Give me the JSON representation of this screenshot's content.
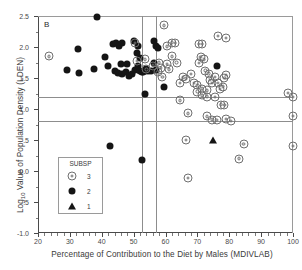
{
  "panel": {
    "label": "B"
  },
  "axes": {
    "xlabel": "Percentage of Contribution to the Diet by Males (MDIVLAB)",
    "ylabel_prefix": "Log",
    "ylabel_sub": "10",
    "ylabel_rest": " Value of Population Density (LDEN)",
    "xticks": [
      "20",
      "30",
      "40",
      "50",
      "60",
      "70",
      "80",
      "90",
      "100"
    ],
    "yticks": [
      "2.5",
      "2.0",
      "1.5",
      "1.0",
      ".5",
      "0.0",
      "-.5",
      "-1.0"
    ]
  },
  "legend": {
    "title": "SUBSP",
    "entries": [
      {
        "label": "3",
        "marker": "open-concentric-circle"
      },
      {
        "label": "2",
        "marker": "filled-circle"
      },
      {
        "label": "1",
        "marker": "filled-triangle"
      }
    ]
  },
  "chart_data": {
    "type": "scatter",
    "title": "",
    "xlabel": "Percentage of Contribution to the Diet by Males (MDIVLAB)",
    "ylabel": "Log10 Value of Population Density (LDEN)",
    "xlim": [
      20,
      100
    ],
    "ylim": [
      -1.0,
      2.5
    ],
    "xtick_values": [
      20,
      30,
      40,
      50,
      60,
      70,
      80,
      90,
      100
    ],
    "ytick_values": [
      2.5,
      2.0,
      1.5,
      1.0,
      0.5,
      0.0,
      -0.5,
      -1.0
    ],
    "grid": false,
    "legend_position": "inside-lower-left",
    "reference_lines": {
      "horizontal": [
        1.2,
        0.8
      ],
      "vertical": [
        52.5,
        57.0
      ]
    },
    "series": [
      {
        "name": "2",
        "marker": "filled-circle",
        "color": "#151515",
        "points": [
          [
            38.5,
            2.49
          ],
          [
            29.0,
            1.63
          ],
          [
            32.5,
            1.96
          ],
          [
            33.0,
            1.58
          ],
          [
            37.5,
            1.64
          ],
          [
            41.0,
            1.84
          ],
          [
            42.0,
            1.7
          ],
          [
            43.5,
            2.05
          ],
          [
            44.5,
            2.07
          ],
          [
            45.5,
            2.02
          ],
          [
            46.5,
            2.06
          ],
          [
            46.0,
            1.72
          ],
          [
            44.0,
            1.62
          ],
          [
            45.0,
            1.58
          ],
          [
            46.5,
            1.56
          ],
          [
            47.5,
            1.6
          ],
          [
            48.0,
            1.72
          ],
          [
            48.5,
            1.54
          ],
          [
            49.5,
            1.56
          ],
          [
            50.5,
            1.63
          ],
          [
            50.0,
            2.09
          ],
          [
            51.0,
            1.9
          ],
          [
            51.5,
            1.7
          ],
          [
            52.0,
            1.61
          ],
          [
            52.5,
            1.6
          ],
          [
            53.0,
            1.59
          ],
          [
            53.5,
            1.62
          ],
          [
            54.0,
            1.64
          ],
          [
            54.5,
            1.62
          ],
          [
            51.5,
            2.02
          ],
          [
            52.0,
            1.82
          ],
          [
            56.5,
            2.1
          ],
          [
            57.0,
            2.02
          ],
          [
            57.5,
            1.98
          ],
          [
            56.5,
            1.74
          ],
          [
            57.0,
            1.63
          ],
          [
            55.5,
            1.61
          ],
          [
            53.5,
            1.25
          ],
          [
            59.5,
            1.35
          ],
          [
            76.0,
            1.7
          ],
          [
            42.5,
            0.4
          ],
          [
            52.5,
            0.17
          ]
        ]
      },
      {
        "name": "3",
        "marker": "open-concentric-circle",
        "color": "#6f6f6f",
        "points": [
          [
            23.5,
            1.85
          ],
          [
            50.5,
            2.06
          ],
          [
            51.0,
            1.77
          ],
          [
            53.5,
            1.8
          ],
          [
            54.0,
            1.64
          ],
          [
            56.0,
            1.7
          ],
          [
            59.5,
            2.35
          ],
          [
            60.5,
            2.01
          ],
          [
            62.0,
            2.07
          ],
          [
            63.0,
            2.06
          ],
          [
            62.0,
            1.85
          ],
          [
            60.5,
            1.73
          ],
          [
            61.0,
            1.64
          ],
          [
            58.5,
            1.66
          ],
          [
            58.0,
            1.75
          ],
          [
            57.5,
            1.59
          ],
          [
            59.0,
            1.52
          ],
          [
            63.5,
            1.75
          ],
          [
            64.5,
            1.42
          ],
          [
            65.5,
            1.51
          ],
          [
            66.5,
            1.49
          ],
          [
            68.0,
            1.56
          ],
          [
            69.0,
            1.42
          ],
          [
            70.5,
            2.05
          ],
          [
            71.5,
            2.05
          ],
          [
            71.0,
            1.84
          ],
          [
            72.0,
            1.8
          ],
          [
            70.5,
            1.74
          ],
          [
            72.5,
            1.62
          ],
          [
            73.5,
            1.57
          ],
          [
            74.0,
            1.47
          ],
          [
            70.0,
            1.38
          ],
          [
            71.5,
            1.33
          ],
          [
            73.0,
            1.3
          ],
          [
            74.5,
            1.42
          ],
          [
            75.5,
            1.52
          ],
          [
            76.5,
            1.42
          ],
          [
            77.0,
            1.32
          ],
          [
            78.0,
            1.36
          ],
          [
            78.5,
            1.5
          ],
          [
            79.0,
            1.55
          ],
          [
            76.5,
            2.18
          ],
          [
            79.0,
            2.15
          ],
          [
            64.5,
            1.14
          ],
          [
            67.0,
            0.93
          ],
          [
            70.0,
            1.28
          ],
          [
            71.5,
            1.22
          ],
          [
            73.0,
            1.2
          ],
          [
            75.5,
            1.19
          ],
          [
            77.5,
            1.07
          ],
          [
            78.5,
            1.06
          ],
          [
            74.5,
            0.83
          ],
          [
            76.0,
            0.82
          ],
          [
            79.0,
            0.84
          ],
          [
            80.5,
            0.81
          ],
          [
            73.0,
            0.88
          ],
          [
            66.5,
            0.5
          ],
          [
            84.5,
            0.44
          ],
          [
            83.0,
            0.2
          ],
          [
            67.0,
            -0.11
          ],
          [
            98.5,
            1.26
          ],
          [
            100.0,
            1.19
          ],
          [
            100.0,
            0.89
          ],
          [
            100.0,
            0.4
          ]
        ]
      },
      {
        "name": "1",
        "marker": "filled-triangle",
        "color": "#151515",
        "points": [
          [
            75.0,
            0.5
          ]
        ]
      }
    ]
  }
}
